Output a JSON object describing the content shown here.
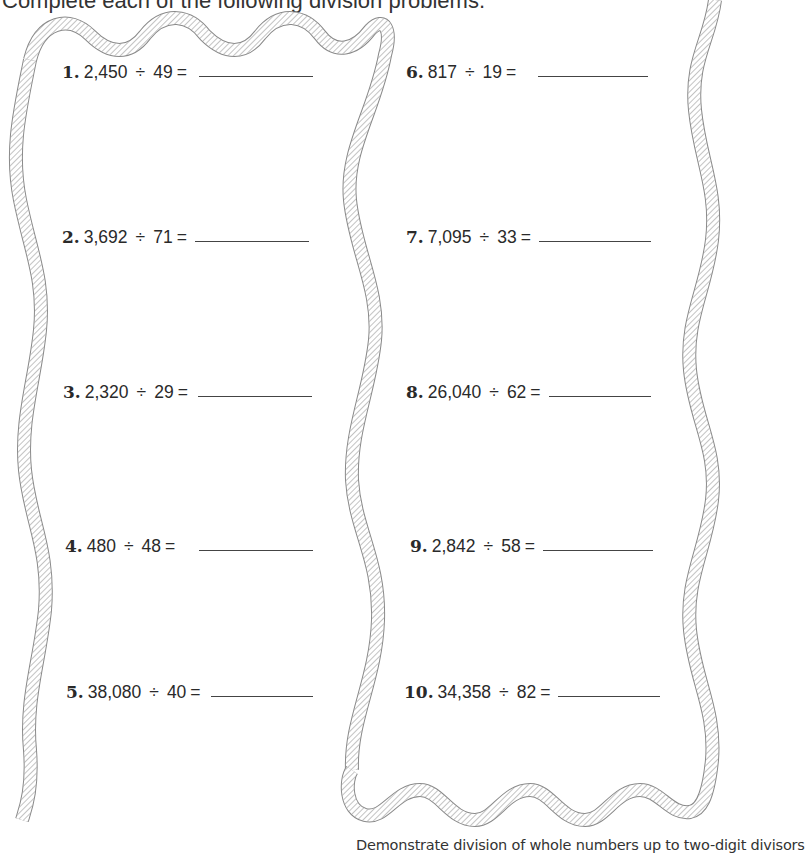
{
  "header": {
    "instruction": "Complete each of the following division problems."
  },
  "problems": [
    {
      "number": "1.",
      "dividend": "2,450",
      "operator": "÷",
      "divisor": "49",
      "equals": "=",
      "answer": ""
    },
    {
      "number": "2.",
      "dividend": "3,692",
      "operator": "÷",
      "divisor": "71",
      "equals": "=",
      "answer": ""
    },
    {
      "number": "3.",
      "dividend": "2,320",
      "operator": "÷",
      "divisor": "29",
      "equals": "=",
      "answer": ""
    },
    {
      "number": "4.",
      "dividend": "480",
      "operator": "÷",
      "divisor": "48",
      "equals": "=",
      "answer": ""
    },
    {
      "number": "5.",
      "dividend": "38,080",
      "operator": "÷",
      "divisor": "40",
      "equals": "=",
      "answer": ""
    },
    {
      "number": "6.",
      "dividend": "817",
      "operator": "÷",
      "divisor": "19",
      "equals": "=",
      "answer": ""
    },
    {
      "number": "7.",
      "dividend": "7,095",
      "operator": "÷",
      "divisor": "33",
      "equals": "=",
      "answer": ""
    },
    {
      "number": "8.",
      "dividend": "26,040",
      "operator": "÷",
      "divisor": "62",
      "equals": "=",
      "answer": ""
    },
    {
      "number": "9.",
      "dividend": "2,842",
      "operator": "÷",
      "divisor": "58",
      "equals": "=",
      "answer": ""
    },
    {
      "number": "10.",
      "dividend": "34,358",
      "operator": "÷",
      "divisor": "82",
      "equals": "=",
      "answer": ""
    }
  ],
  "footer": {
    "objective": "Demonstrate division of whole numbers up to two-digit divisors"
  },
  "decorations": {
    "border_style": "rope",
    "rope_color": "#8a8a8a"
  }
}
